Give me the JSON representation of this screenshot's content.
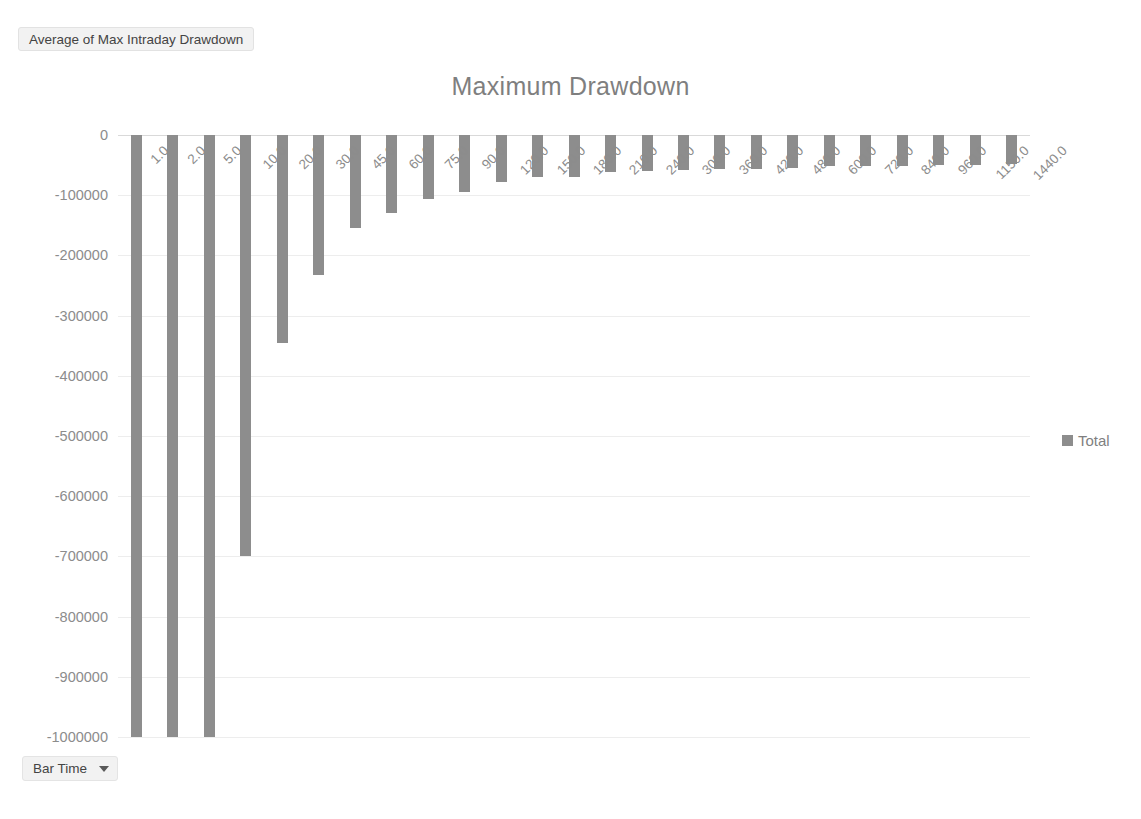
{
  "pivot": {
    "value_field_label": "Average of Max Intraday Drawdown",
    "axis_field_label": "Bar Time",
    "axis_field_caret_icon": "chevron-down-icon"
  },
  "legend": {
    "position": "right",
    "entries": [
      {
        "label": "Total",
        "color": "#8d8d8d",
        "marker_icon": "legend-square-icon"
      }
    ]
  },
  "chart_data": {
    "type": "bar",
    "title": "Maximum Drawdown",
    "xlabel": "",
    "ylabel": "",
    "ylim": [
      -1000000,
      0
    ],
    "ytick_step": 100000,
    "grid": true,
    "bar_color": "#8d8d8d",
    "legend_position": "right",
    "ytick_labels": [
      "0",
      "-100000",
      "-200000",
      "-300000",
      "-400000",
      "-500000",
      "-600000",
      "-700000",
      "-800000",
      "-900000",
      "-1000000"
    ],
    "yticks": [
      0,
      -100000,
      -200000,
      -300000,
      -400000,
      -500000,
      -600000,
      -700000,
      -800000,
      -900000,
      -1000000
    ],
    "categories": [
      "1.0",
      "2.0",
      "5.0",
      "10.0",
      "20.0",
      "30.0",
      "45.0",
      "60.0",
      "75.0",
      "90.0",
      "120.0",
      "150.0",
      "180.0",
      "210.0",
      "240.0",
      "300.0",
      "360.0",
      "420.0",
      "480.0",
      "600.0",
      "720.0",
      "840.0",
      "960.0",
      "1150.0",
      "1440.0"
    ],
    "series": [
      {
        "name": "Total",
        "values": [
          -1000000,
          -1000000,
          -1000000,
          -700000,
          -345000,
          -233000,
          -155000,
          -130000,
          -107000,
          -95000,
          -78000,
          -70000,
          -70000,
          -62000,
          -60000,
          -58000,
          -57000,
          -56000,
          -55000,
          -52000,
          -52000,
          -52000,
          -50000,
          -50000,
          -48000
        ]
      }
    ]
  }
}
